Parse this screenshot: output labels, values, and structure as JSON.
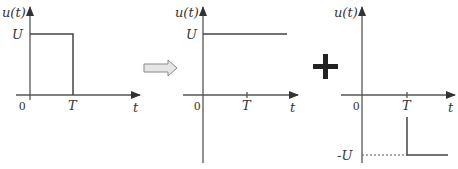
{
  "diagram": {
    "operator_symbol": "+",
    "transform_arrow": "hollow-right-arrow",
    "colors": {
      "axis": "#555555",
      "signal": "#444444",
      "text": "#333333",
      "arrow_fill": "#e6e6e6",
      "arrow_stroke": "#888888"
    },
    "plots": [
      {
        "name": "rectangular-pulse",
        "y_label": "u(t)",
        "x_label": "t",
        "origin_label": "0",
        "ticks": {
          "x": [
            "T"
          ],
          "y": [
            "U"
          ]
        },
        "description": "u(t)=U for 0<t<T, 0 otherwise"
      },
      {
        "name": "positive-step",
        "y_label": "u(t)",
        "x_label": "t",
        "origin_label": "0",
        "ticks": {
          "x": [
            "T"
          ],
          "y": [
            "U"
          ]
        },
        "description": "u(t)=U for t>0"
      },
      {
        "name": "negative-delayed-step",
        "y_label": "u(t)",
        "x_label": "t",
        "origin_label": "0",
        "ticks": {
          "x": [
            "T"
          ],
          "y": [
            "-U"
          ]
        },
        "description": "u(t)=-U for t>T"
      }
    ]
  }
}
